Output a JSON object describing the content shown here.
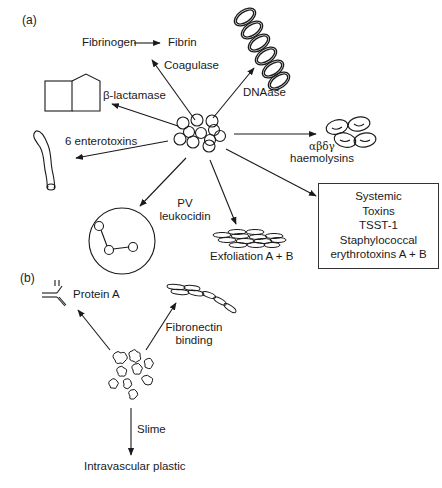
{
  "panel_a": {
    "label": "(a)",
    "center": "Staphylococcus aureus cluster",
    "labels": {
      "fibrinogen": "Fibrinogen",
      "fibrin": "Fibrin",
      "coagulase": "Coagulase",
      "dnaase": "DNAase",
      "beta_lactamase": "β-lactamase",
      "enterotoxins": "6 enterotoxins",
      "haemolysins_greek": "αβδγ",
      "haemolysins": "haemolysins",
      "pv_line1": "PV",
      "pv_line2": "leukocidin",
      "exfoliation": "Exfoliation A + B"
    },
    "systemic_box": {
      "lines": [
        "Systemic",
        "Toxins",
        "TSST-1",
        "Staphylococcal",
        "erythrotoxins A + B"
      ]
    }
  },
  "panel_b": {
    "label": "(b)",
    "labels": {
      "protein_a": "Protein A",
      "fibronectin_line1": "Fibronectin",
      "fibronectin_line2": "binding",
      "slime": "Slime",
      "intravascular": "Intravascular plastic"
    }
  },
  "colors": {
    "ink": "#1a1a1a",
    "background": "#ffffff"
  }
}
